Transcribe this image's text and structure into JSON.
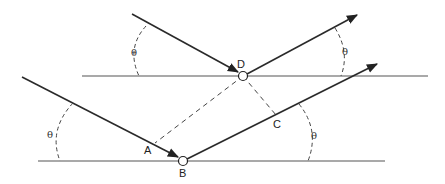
{
  "diagram": {
    "colors": {
      "line": "#2a2a2a",
      "plane": "#555555",
      "dashed": "#444444",
      "background": "#ffffff"
    },
    "points": {
      "A": {
        "label": "A"
      },
      "B": {
        "label": "B"
      },
      "C": {
        "label": "C"
      },
      "D": {
        "label": "D"
      }
    },
    "angle_label": "θ",
    "angles": [
      {
        "id": "top-incident",
        "label": "θ"
      },
      {
        "id": "top-reflected",
        "label": "θ"
      },
      {
        "id": "bottom-incident",
        "label": "θ"
      },
      {
        "id": "bottom-reflected",
        "label": "θ"
      }
    ],
    "planes": [
      "upper-plane",
      "lower-plane"
    ],
    "rays": [
      "upper-incident",
      "upper-reflected",
      "lower-incident",
      "lower-reflected"
    ],
    "construction_lines": [
      "D-A",
      "D-C"
    ]
  }
}
